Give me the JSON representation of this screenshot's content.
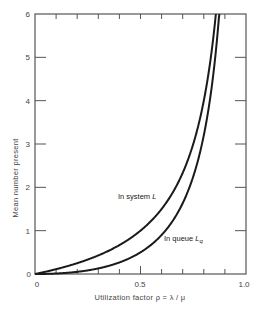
{
  "chart_data": {
    "type": "line",
    "title": "",
    "xlabel": "Utilization factor ρ = λ / μ",
    "ylabel": "Mean number present",
    "xlim": [
      0,
      1.0
    ],
    "ylim": [
      0,
      6
    ],
    "x_ticks": [
      0,
      0.1,
      0.2,
      0.3,
      0.4,
      0.5,
      0.6,
      0.7,
      0.8,
      0.9,
      1.0
    ],
    "x_tick_labels": {
      "0": "0",
      "0.5": "0.5",
      "1.0": "1.0"
    },
    "y_ticks": [
      0,
      1,
      2,
      3,
      4,
      5,
      6
    ],
    "y_tick_labels": [
      "0",
      "1",
      "2",
      "3",
      "4",
      "5",
      "6"
    ],
    "grid": false,
    "legend": "none (inline curve labels)",
    "series": [
      {
        "name": "In system L",
        "formula": "L = ρ / (1 − ρ)",
        "x": [
          0,
          0.1,
          0.2,
          0.3,
          0.4,
          0.5,
          0.6,
          0.7,
          0.75,
          0.8,
          0.857
        ],
        "values": [
          0,
          0.11,
          0.25,
          0.43,
          0.67,
          1.0,
          1.5,
          2.33,
          3.0,
          4.0,
          6.0
        ]
      },
      {
        "name": "In queue Lq",
        "formula": "Lq = ρ² / (1 − ρ)",
        "x": [
          0,
          0.1,
          0.2,
          0.3,
          0.4,
          0.5,
          0.6,
          0.7,
          0.75,
          0.8,
          0.85,
          0.873
        ],
        "values": [
          0,
          0.011,
          0.05,
          0.13,
          0.27,
          0.5,
          0.9,
          1.63,
          2.25,
          3.2,
          4.82,
          6.0
        ]
      }
    ],
    "annotations": [
      {
        "text": "In system L",
        "near": [
          0.6,
          1.7
        ]
      },
      {
        "text": "In queue Lq",
        "near": [
          0.7,
          0.8
        ]
      }
    ]
  },
  "labels": {
    "y_axis_title": "Mean number present",
    "x_axis_title": "Utilization factor ρ = λ / μ",
    "curve_system_prefix": "In system ",
    "curve_system_symbol": "L",
    "curve_queue_prefix": "In queue ",
    "curve_queue_symbol": "L",
    "curve_queue_subscript": "q",
    "x_tick_0": "0",
    "x_tick_05": "0.5",
    "x_tick_10": "1.0",
    "y_tick_0": "0",
    "y_tick_1": "1",
    "y_tick_2": "2",
    "y_tick_3": "3",
    "y_tick_4": "4",
    "y_tick_5": "5",
    "y_tick_6": "6"
  },
  "colors": {
    "axis": "#555555",
    "curve": "#1a1a1a",
    "text": "#444444"
  }
}
